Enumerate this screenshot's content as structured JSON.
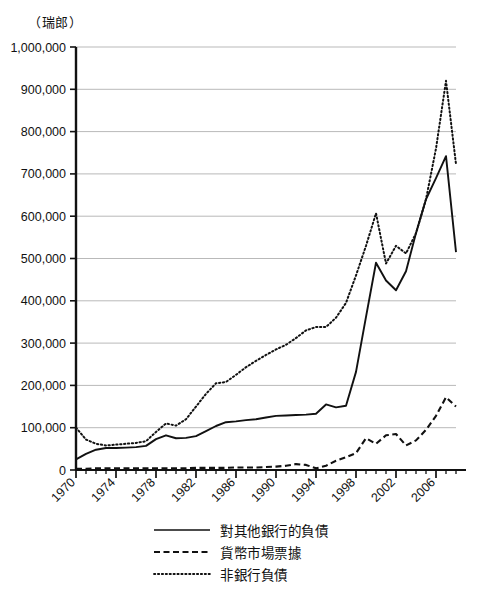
{
  "chart_data": {
    "type": "line",
    "title": "",
    "subtitle": "",
    "unit_label": "（瑞郎）",
    "xlabel": "",
    "ylabel": "",
    "ylim": [
      0,
      1000000
    ],
    "xlim": [
      1970,
      2008
    ],
    "grid": true,
    "legend_position": "bottom",
    "y_ticks": [
      0,
      100000,
      200000,
      300000,
      400000,
      500000,
      600000,
      700000,
      800000,
      900000,
      1000000
    ],
    "y_tick_labels": [
      "0",
      "100,000",
      "200,000",
      "300,000",
      "400,000",
      "500,000",
      "600,000",
      "700,000",
      "800,000",
      "900,000",
      "1,000,000"
    ],
    "x_ticks": [
      1970,
      1974,
      1978,
      1982,
      1986,
      1990,
      1994,
      1998,
      2002,
      2006
    ],
    "x_tick_labels": [
      "1970",
      "1974",
      "1978",
      "1982",
      "1986",
      "1990",
      "1994",
      "1998",
      "2002",
      "2006"
    ],
    "x_minor_ticks": [
      1971,
      1972,
      1973,
      1975,
      1976,
      1977,
      1979,
      1980,
      1981,
      1983,
      1984,
      1985,
      1987,
      1988,
      1989,
      1991,
      1992,
      1993,
      1995,
      1996,
      1997,
      1999,
      2000,
      2001,
      2003,
      2004,
      2005,
      2007,
      2008
    ],
    "x": [
      1970,
      1971,
      1972,
      1973,
      1974,
      1975,
      1976,
      1977,
      1978,
      1979,
      1980,
      1981,
      1982,
      1983,
      1984,
      1985,
      1986,
      1987,
      1988,
      1989,
      1990,
      1991,
      1992,
      1993,
      1994,
      1995,
      1996,
      1997,
      1998,
      1999,
      2000,
      2001,
      2002,
      2003,
      2004,
      2005,
      2006,
      2007,
      2008
    ],
    "series": [
      {
        "name": "對其他銀行的負債",
        "style": "solid",
        "color": "#111111",
        "values": [
          25000,
          38000,
          48000,
          52000,
          52000,
          53000,
          54000,
          57000,
          73000,
          82000,
          75000,
          76000,
          80000,
          92000,
          104000,
          113000,
          115000,
          118000,
          120000,
          124000,
          128000,
          129000,
          130000,
          131000,
          133000,
          155000,
          148000,
          152000,
          232000,
          362000,
          490000,
          448000,
          425000,
          470000,
          560000,
          640000,
          690000,
          742000,
          515000
        ]
      },
      {
        "name": "貨幣市場票據",
        "style": "dashed",
        "color": "#111111",
        "values": [
          3000,
          3000,
          4000,
          4000,
          4000,
          4000,
          4000,
          4000,
          4000,
          4000,
          4000,
          4000,
          5000,
          5000,
          5000,
          5000,
          6000,
          6000,
          6000,
          7000,
          8000,
          10000,
          14000,
          12000,
          4000,
          10000,
          22000,
          30000,
          40000,
          75000,
          62000,
          82000,
          85000,
          58000,
          70000,
          95000,
          128000,
          172000,
          150000
        ]
      },
      {
        "name": "非銀行負債",
        "style": "dotted",
        "color": "#111111",
        "values": [
          100000,
          72000,
          62000,
          58000,
          60000,
          62000,
          64000,
          68000,
          90000,
          110000,
          105000,
          120000,
          150000,
          180000,
          205000,
          208000,
          225000,
          243000,
          258000,
          272000,
          285000,
          296000,
          312000,
          330000,
          338000,
          338000,
          360000,
          395000,
          460000,
          530000,
          607000,
          488000,
          530000,
          512000,
          560000,
          640000,
          760000,
          920000,
          723000
        ]
      }
    ]
  },
  "legend": {
    "items": [
      {
        "label": "對其他銀行的負債",
        "style": "solid"
      },
      {
        "label": "貨幣市場票據",
        "style": "dashed"
      },
      {
        "label": "非銀行負債",
        "style": "dotted"
      }
    ]
  }
}
